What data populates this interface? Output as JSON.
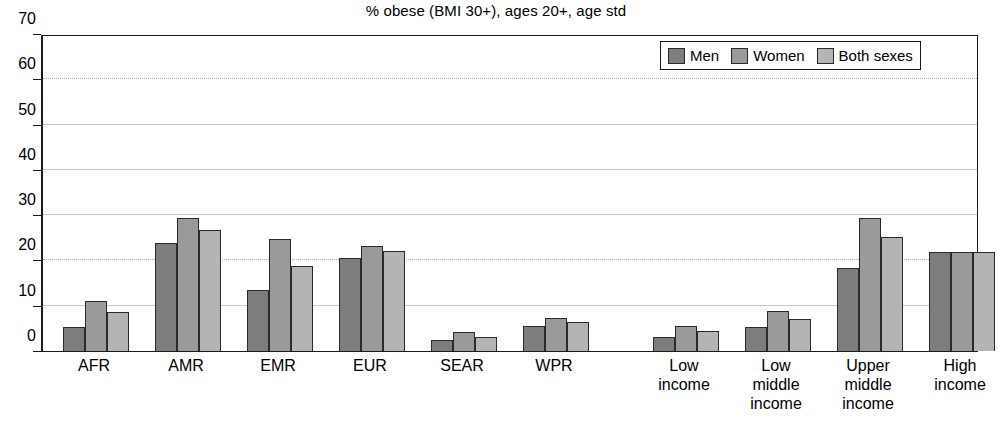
{
  "chart_data": {
    "type": "bar",
    "title": "% obese (BMI 30+), ages 20+, age std",
    "xlabel": "",
    "ylabel": "",
    "ylim": [
      0,
      70
    ],
    "ytick_step": 10,
    "yticks": [
      70,
      60,
      50,
      40,
      30,
      20,
      10,
      0
    ],
    "grid": true,
    "legend_position": "top-right",
    "categories": [
      "AFR",
      "AMR",
      "EMR",
      "EUR",
      "SEAR",
      "WPR",
      "Low\nincome",
      "Low\nmiddle\nincome",
      "Upper\nmiddle\nincome",
      "High\nincome"
    ],
    "group_break_after_index": 5,
    "series": [
      {
        "name": "Men",
        "color": "#7d7d7d",
        "values": [
          5.4,
          23.9,
          13.4,
          20.6,
          2.4,
          5.6,
          3.2,
          5.2,
          18.4,
          21.8
        ]
      },
      {
        "name": "Women",
        "color": "#9a9a9a",
        "values": [
          11.0,
          29.4,
          24.8,
          23.2,
          4.1,
          7.3,
          5.5,
          8.9,
          29.4,
          21.8
        ]
      },
      {
        "name": "Both sexes",
        "color": "#b4b4b4",
        "values": [
          8.6,
          26.7,
          18.8,
          22.0,
          3.2,
          6.4,
          4.4,
          7.1,
          25.2,
          21.8
        ]
      }
    ]
  },
  "legend": {
    "items": [
      {
        "label": "Men"
      },
      {
        "label": "Women"
      },
      {
        "label": "Both sexes"
      }
    ]
  }
}
